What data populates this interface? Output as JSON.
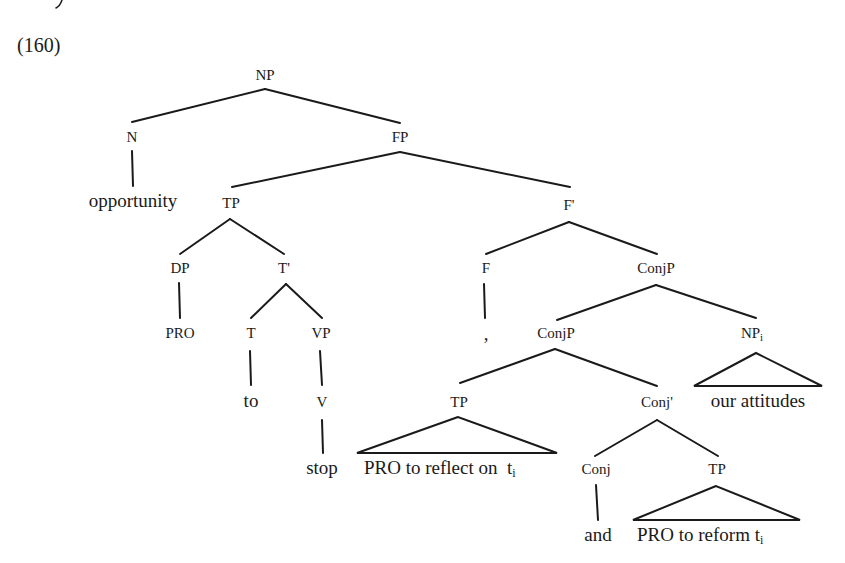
{
  "example_number": "(160)",
  "nodes": {
    "np_root": "NP",
    "n": "N",
    "fp": "FP",
    "opportunity": "opportunity",
    "tp1": "TP",
    "fbar": "F'",
    "dp": "DP",
    "tbar": "T'",
    "f": "F",
    "conjp1": "ConjP",
    "pro1": "PRO",
    "t": "T",
    "vp": "VP",
    "comma": ",",
    "conjp2": "ConjP",
    "np_i": "NP",
    "np_i_sub": "i",
    "to": "to",
    "v": "V",
    "tp2": "TP",
    "conjbar": "Conj'",
    "our_attitudes": "our attitudes",
    "stop": "stop",
    "tp2_text": "PRO to reflect on  t",
    "tp2_text_sub": "i",
    "conj": "Conj",
    "tp3": "TP",
    "and": "and",
    "tp3_text": "PRO to reform t",
    "tp3_text_sub": "i"
  }
}
